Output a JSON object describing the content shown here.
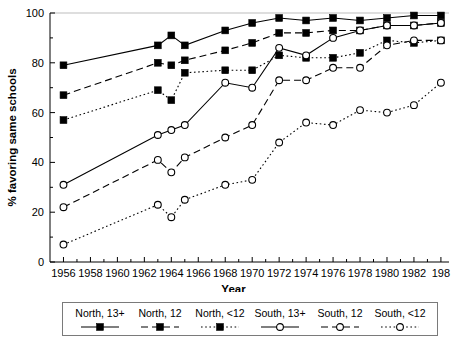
{
  "chart_data": {
    "type": "line",
    "title": "",
    "xlabel": "Year",
    "ylabel": "% favoring same schools",
    "xlim": [
      1955,
      1984.6
    ],
    "ylim": [
      0,
      100
    ],
    "grid": false,
    "legend_position": "bottom",
    "x_ticks": [
      1956,
      1957,
      1958,
      1959,
      1960,
      1961,
      1962,
      1963,
      1964,
      1965,
      1966,
      1967,
      1968,
      1969,
      1970,
      1971,
      1972,
      1973,
      1974,
      1975,
      1976,
      1977,
      1978,
      1979,
      1980,
      1981,
      1982,
      1983,
      1984
    ],
    "x_tick_labels": [
      "1956",
      "",
      "1958",
      "",
      "1960",
      "",
      "1962",
      "",
      "1964",
      "",
      "1966",
      "",
      "1968",
      "",
      "1970",
      "",
      "1972",
      "",
      "1974",
      "",
      "1976",
      "",
      "1978",
      "",
      "1980",
      "",
      "1982",
      "",
      "198"
    ],
    "y_ticks": [
      0,
      10,
      20,
      30,
      40,
      50,
      60,
      70,
      80,
      90,
      100
    ],
    "y_tick_labels": [
      "0",
      "",
      "20",
      "",
      "40",
      "",
      "60",
      "",
      "80",
      "",
      "100"
    ],
    "series": [
      {
        "name": "North, 13+",
        "marker": "filled-square",
        "line_style": "solid",
        "color": "#000000",
        "x": [
          1956,
          1963,
          1964,
          1965,
          1968,
          1970,
          1972,
          1974,
          1976,
          1978,
          1980,
          1982,
          1984
        ],
        "y": [
          79,
          87,
          91,
          87,
          93,
          96,
          98,
          97,
          98,
          97,
          98,
          99,
          99
        ]
      },
      {
        "name": "North, 12",
        "marker": "filled-square",
        "line_style": "dashed",
        "color": "#000000",
        "x": [
          1956,
          1963,
          1964,
          1965,
          1968,
          1970,
          1972,
          1974,
          1976,
          1978,
          1980,
          1982,
          1984
        ],
        "y": [
          67,
          80,
          79,
          81,
          85,
          88,
          92,
          92,
          93,
          93,
          95,
          95,
          96
        ]
      },
      {
        "name": "North, <12",
        "marker": "filled-square",
        "line_style": "dotted",
        "color": "#000000",
        "x": [
          1956,
          1963,
          1964,
          1965,
          1968,
          1970,
          1972,
          1974,
          1976,
          1978,
          1980,
          1982,
          1984
        ],
        "y": [
          57,
          69,
          65,
          76,
          77,
          77,
          83,
          82,
          82,
          84,
          89,
          88,
          89
        ]
      },
      {
        "name": "South, 13+",
        "marker": "open-circle",
        "line_style": "solid",
        "color": "#000000",
        "x": [
          1956,
          1963,
          1964,
          1965,
          1968,
          1970,
          1972,
          1974,
          1976,
          1978,
          1980,
          1982,
          1984
        ],
        "y": [
          31,
          51,
          53,
          55,
          72,
          70,
          86,
          83,
          90,
          93,
          95,
          95,
          96
        ]
      },
      {
        "name": "South, 12",
        "marker": "open-circle",
        "line_style": "dashed",
        "color": "#000000",
        "x": [
          1956,
          1963,
          1964,
          1965,
          1968,
          1970,
          1972,
          1974,
          1976,
          1978,
          1980,
          1982,
          1984
        ],
        "y": [
          22,
          41,
          36,
          42,
          50,
          55,
          73,
          73,
          78,
          78,
          87,
          89,
          89
        ]
      },
      {
        "name": "South, <12",
        "marker": "open-circle",
        "line_style": "dotted",
        "color": "#000000",
        "x": [
          1956,
          1963,
          1964,
          1965,
          1968,
          1970,
          1972,
          1974,
          1976,
          1978,
          1980,
          1982,
          1984
        ],
        "y": [
          7,
          23,
          18,
          25,
          31,
          33,
          48,
          56,
          55,
          61,
          60,
          63,
          72
        ]
      }
    ]
  },
  "legend": {
    "entries": [
      {
        "label": "North, 13+",
        "marker": "filled-square",
        "line_style": "solid"
      },
      {
        "label": "North, 12",
        "marker": "filled-square",
        "line_style": "dashed"
      },
      {
        "label": "North, <12",
        "marker": "filled-square",
        "line_style": "dotted"
      },
      {
        "label": "South, 13+",
        "marker": "open-circle",
        "line_style": "solid"
      },
      {
        "label": "South, 12",
        "marker": "open-circle",
        "line_style": "dashed"
      },
      {
        "label": "South, <12",
        "marker": "open-circle",
        "line_style": "dotted"
      }
    ]
  }
}
